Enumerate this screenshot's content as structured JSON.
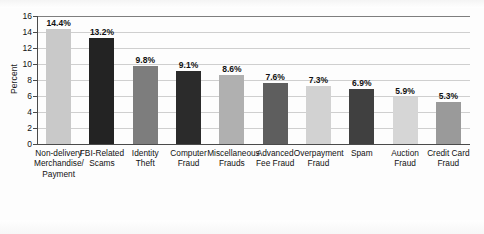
{
  "chart_data": {
    "type": "bar",
    "title": "",
    "subtitle": "",
    "xlabel": "",
    "ylabel": "Percent",
    "ylim": [
      0,
      16
    ],
    "ytick_labels": [
      "16",
      "14",
      "12",
      "10",
      "8",
      "6",
      "4",
      "2",
      "0"
    ],
    "ytick_values": [
      16,
      14,
      12,
      10,
      8,
      6,
      4,
      2,
      0
    ],
    "grid": "horizontal",
    "legend": "none",
    "value_suffix": "%",
    "categories": [
      "Non-delivery Merchandise/ Payment",
      "FBI-Related Scams",
      "Identity Theft",
      "Computer Fraud",
      "Miscellaneous Frauds",
      "Advanced Fee Fraud",
      "Overpayment Fraud",
      "Spam",
      "Auction Fraud",
      "Credit Card Fraud"
    ],
    "values": [
      14.4,
      13.2,
      9.8,
      9.1,
      8.6,
      7.6,
      7.3,
      6.9,
      5.9,
      5.3
    ],
    "data_labels": [
      "14.4%",
      "13.2%",
      "9.8%",
      "9.1%",
      "8.6%",
      "7.6%",
      "7.3%",
      "6.9%",
      "5.9%",
      "5.3%"
    ],
    "bar_colors": [
      "#c9c9c9",
      "#232323",
      "#7d7d7d",
      "#2b2b2b",
      "#b0b0b0",
      "#5e5e5e",
      "#d2d2d2",
      "#404040",
      "#d6d6d6",
      "#9a9a9a"
    ],
    "bars": [
      {
        "label_lines": [
          "Non-delivery",
          "Merchandise/",
          "Payment"
        ],
        "value": 14.4,
        "data_label": "14.4%",
        "color": "#c9c9c9"
      },
      {
        "label_lines": [
          "FBI-Related",
          "Scams"
        ],
        "value": 13.2,
        "data_label": "13.2%",
        "color": "#232323"
      },
      {
        "label_lines": [
          "Identity",
          "Theft"
        ],
        "value": 9.8,
        "data_label": "9.8%",
        "color": "#7d7d7d"
      },
      {
        "label_lines": [
          "Computer",
          "Fraud"
        ],
        "value": 9.1,
        "data_label": "9.1%",
        "color": "#2b2b2b"
      },
      {
        "label_lines": [
          "Miscellaneous",
          "Frauds"
        ],
        "value": 8.6,
        "data_label": "8.6%",
        "color": "#b0b0b0"
      },
      {
        "label_lines": [
          "Advanced",
          "Fee Fraud"
        ],
        "value": 7.6,
        "data_label": "7.6%",
        "color": "#5e5e5e"
      },
      {
        "label_lines": [
          "Overpayment",
          "Fraud"
        ],
        "value": 7.3,
        "data_label": "7.3%",
        "color": "#d2d2d2"
      },
      {
        "label_lines": [
          "Spam"
        ],
        "value": 6.9,
        "data_label": "6.9%",
        "color": "#404040"
      },
      {
        "label_lines": [
          "Auction",
          "Fraud"
        ],
        "value": 5.9,
        "data_label": "5.9%",
        "color": "#d6d6d6"
      },
      {
        "label_lines": [
          "Credit Card",
          "Fraud"
        ],
        "value": 5.3,
        "data_label": "5.3%",
        "color": "#9a9a9a"
      }
    ],
    "colors": {
      "axis": "#4a4a4a",
      "grid": "#cfcfcf",
      "text": "#111111",
      "background": "#fdfdfd"
    }
  }
}
